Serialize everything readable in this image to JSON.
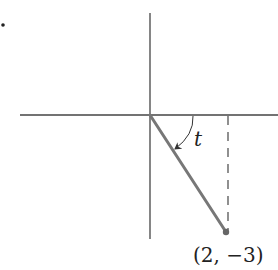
{
  "diagram": {
    "type": "coordinate-angle",
    "list_marker": "•",
    "angle_label": "t",
    "point_label": "(2, −3)",
    "point": {
      "x": 2,
      "y": -3
    },
    "colors": {
      "axes": "#444444",
      "terminal_side": "#777777",
      "point": "#666666",
      "dashed": "#555555",
      "arc": "#333333",
      "text": "#222222"
    },
    "geometry": {
      "origin_px": [
        150,
        115
      ],
      "point_px": [
        226,
        232
      ],
      "h_axis_px": [
        20,
        278
      ],
      "v_axis_px": [
        13,
        239
      ],
      "dashed_x_px": 228
    }
  }
}
